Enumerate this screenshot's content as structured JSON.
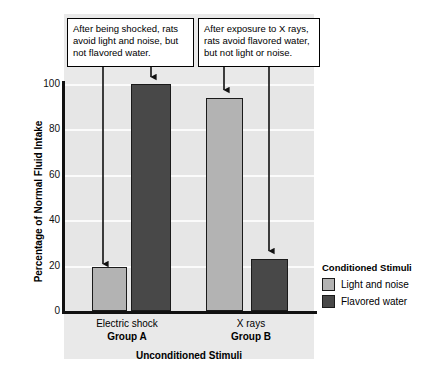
{
  "chart_data": {
    "type": "bar",
    "title": "",
    "xlabel": "Unconditioned Stimuli",
    "ylabel": "Percentage of Normal Fluid Intake",
    "ylim": [
      0,
      100
    ],
    "yticks": [
      100,
      80,
      60,
      40,
      20,
      0
    ],
    "grid": true,
    "legend_position": "right",
    "legend_title": "Conditioned Stimuli",
    "categories": [
      "Group A",
      "Group B"
    ],
    "category_sublabels": [
      "Electric shock",
      "X rays"
    ],
    "series": [
      {
        "name": "Light and noise",
        "color": "#b3b3b3",
        "values": [
          19.5,
          94
        ]
      },
      {
        "name": "Flavored water",
        "color": "#484848",
        "values": [
          100,
          23
        ]
      }
    ],
    "annotations": [
      {
        "id": "callout-a",
        "text": "After being shocked, rats avoid light and noise, but not flavored water.",
        "points_to": [
          "Group A / Light and noise",
          "Group A / Flavored water"
        ]
      },
      {
        "id": "callout-b",
        "text": "After exposure to X rays, rats avoid flavored water, but not light or noise.",
        "points_to": [
          "Group B / Light and noise",
          "Group B / Flavored water"
        ]
      }
    ]
  },
  "axes": {
    "y_title": "Percentage of Normal Fluid Intake",
    "x_title": "Unconditioned Stimuli",
    "y_tick_labels": [
      "100",
      "80",
      "60",
      "40",
      "20",
      "0"
    ]
  },
  "groups": [
    {
      "sublabel": "Electric shock",
      "name": "Group A"
    },
    {
      "sublabel": "X rays",
      "name": "Group B"
    }
  ],
  "legend": {
    "title": "Conditioned Stimuli",
    "items": [
      {
        "label": "Light and noise",
        "color": "#b3b3b3"
      },
      {
        "label": "Flavored water",
        "color": "#484848"
      }
    ]
  },
  "callouts": {
    "a": "After being shocked, rats avoid light and noise, but not flavored water.",
    "b": "After exposure to X rays, rats avoid flavored water, but not light or noise."
  },
  "colors": {
    "light_bar": "#b3b3b3",
    "dark_bar": "#484848",
    "plot_background": "#e6e6e6",
    "gridline": "#fbfbfb",
    "axis": "#111111"
  }
}
